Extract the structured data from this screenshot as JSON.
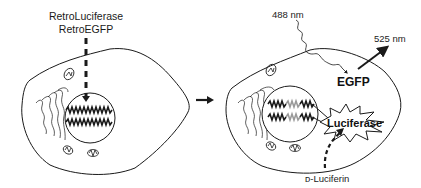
{
  "figure": {
    "left_panel": {
      "vector_label_line1": "RetroLuciferase",
      "vector_label_line2": "RetroEGFP"
    },
    "transition_arrow": "right-arrow",
    "right_panel": {
      "excitation_label": "488 nm",
      "emission_label": "525 nm",
      "fluorescent_protein_label": "EGFP",
      "enzyme_label": "Luciferase",
      "substrate_label": "D-Luciferin",
      "substrate_label_display": "ᴅ-Luciferin"
    },
    "colors": {
      "line": "#1a1a1a",
      "background": "#ffffff",
      "integrated_gene": "#9a9a9a"
    }
  }
}
